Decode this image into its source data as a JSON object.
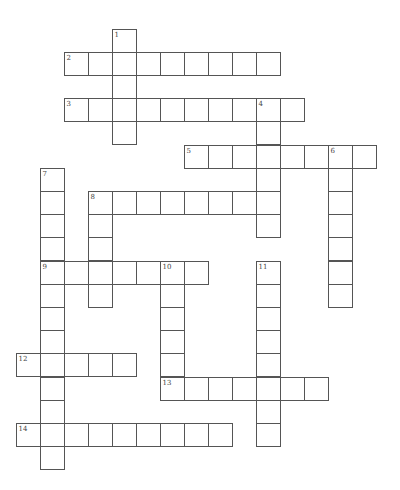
{
  "puzzle": {
    "grid": {
      "origin_x": 16,
      "origin_y": 29,
      "cell_w": 24,
      "cell_h": 23.2,
      "border_color": "#555555",
      "number_color": "#444444",
      "background": "#ffffff"
    },
    "entries": [
      {
        "number": "1",
        "direction": "down",
        "row": 0,
        "col": 4,
        "length": 5
      },
      {
        "number": "2",
        "direction": "across",
        "row": 1,
        "col": 2,
        "length": 9
      },
      {
        "number": "3",
        "direction": "across",
        "row": 3,
        "col": 2,
        "length": 10
      },
      {
        "number": "4",
        "direction": "down",
        "row": 3,
        "col": 10,
        "length": 6
      },
      {
        "number": "5",
        "direction": "across",
        "row": 5,
        "col": 7,
        "length": 8
      },
      {
        "number": "6",
        "direction": "down",
        "row": 5,
        "col": 13,
        "length": 7
      },
      {
        "number": "7",
        "direction": "down",
        "row": 6,
        "col": 1,
        "length": 13
      },
      {
        "number": "8",
        "direction": "across",
        "row": 7,
        "col": 3,
        "length": 8
      },
      {
        "number": "8",
        "direction": "down",
        "row": 7,
        "col": 3,
        "length": 5
      },
      {
        "number": "9",
        "direction": "across",
        "row": 10,
        "col": 1,
        "length": 7
      },
      {
        "number": "10",
        "direction": "down",
        "row": 10,
        "col": 6,
        "length": 6
      },
      {
        "number": "11",
        "direction": "down",
        "row": 10,
        "col": 10,
        "length": 8
      },
      {
        "number": "12",
        "direction": "across",
        "row": 14,
        "col": 0,
        "length": 5
      },
      {
        "number": "13",
        "direction": "across",
        "row": 15,
        "col": 6,
        "length": 7
      },
      {
        "number": "14",
        "direction": "across",
        "row": 17,
        "col": 0,
        "length": 9
      }
    ]
  }
}
